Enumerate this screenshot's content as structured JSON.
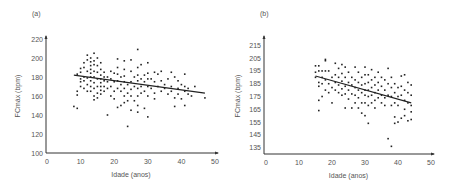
{
  "chart_data": [
    {
      "panel_label": "(a)",
      "type": "scatter",
      "xlabel": "Idade (anos)",
      "ylabel": "FCmáx (bpm)",
      "xlim": [
        0,
        50
      ],
      "ylim": [
        100,
        220
      ],
      "xticks": [
        0,
        10,
        20,
        30,
        40,
        50
      ],
      "yticks": [
        100,
        120,
        140,
        160,
        180,
        200,
        220
      ],
      "grid": false,
      "trendline": {
        "x": [
          8,
          47
        ],
        "y": [
          182,
          163
        ]
      },
      "points": [
        [
          8,
          149
        ],
        [
          9,
          147
        ],
        [
          9,
          183
        ],
        [
          9,
          161
        ],
        [
          9,
          165
        ],
        [
          10,
          189
        ],
        [
          10,
          185
        ],
        [
          10,
          175
        ],
        [
          10,
          170
        ],
        [
          10,
          178
        ],
        [
          11,
          195
        ],
        [
          11,
          190
        ],
        [
          11,
          180
        ],
        [
          11,
          176
        ],
        [
          11,
          168
        ],
        [
          12,
          203
        ],
        [
          12,
          198
        ],
        [
          12,
          186
        ],
        [
          12,
          179
        ],
        [
          12,
          172
        ],
        [
          12,
          165
        ],
        [
          13,
          200
        ],
        [
          13,
          196
        ],
        [
          13,
          192
        ],
        [
          13,
          188
        ],
        [
          13,
          184
        ],
        [
          13,
          180
        ],
        [
          13,
          176
        ],
        [
          13,
          170
        ],
        [
          13,
          165
        ],
        [
          14,
          205
        ],
        [
          14,
          197
        ],
        [
          14,
          193
        ],
        [
          14,
          186
        ],
        [
          14,
          180
        ],
        [
          14,
          174
        ],
        [
          14,
          168
        ],
        [
          14,
          160
        ],
        [
          14,
          156
        ],
        [
          15,
          200
        ],
        [
          15,
          192
        ],
        [
          15,
          185
        ],
        [
          15,
          178
        ],
        [
          15,
          170
        ],
        [
          15,
          163
        ],
        [
          15,
          158
        ],
        [
          16,
          195
        ],
        [
          16,
          188
        ],
        [
          16,
          182
        ],
        [
          16,
          178
        ],
        [
          16,
          174
        ],
        [
          16,
          170
        ],
        [
          16,
          166
        ],
        [
          16,
          162
        ],
        [
          17,
          185
        ],
        [
          17,
          180
        ],
        [
          17,
          176
        ],
        [
          17,
          170
        ],
        [
          17,
          165
        ],
        [
          18,
          140
        ],
        [
          18,
          175
        ],
        [
          18,
          180
        ],
        [
          18,
          168
        ],
        [
          19,
          186
        ],
        [
          19,
          178
        ],
        [
          19,
          170
        ],
        [
          19,
          160
        ],
        [
          20,
          184
        ],
        [
          20,
          175
        ],
        [
          20,
          165
        ],
        [
          20,
          157
        ],
        [
          21,
          199
        ],
        [
          21,
          190
        ],
        [
          21,
          183
        ],
        [
          21,
          176
        ],
        [
          21,
          168
        ],
        [
          21,
          148
        ],
        [
          22,
          180
        ],
        [
          22,
          172
        ],
        [
          22,
          165
        ],
        [
          22,
          150
        ],
        [
          23,
          197
        ],
        [
          23,
          188
        ],
        [
          23,
          181
        ],
        [
          23,
          175
        ],
        [
          23,
          168
        ],
        [
          23,
          160
        ],
        [
          23,
          153
        ],
        [
          24,
          128
        ],
        [
          24,
          172
        ],
        [
          24,
          163
        ],
        [
          24,
          155
        ],
        [
          25,
          198
        ],
        [
          25,
          186
        ],
        [
          25,
          175
        ],
        [
          25,
          167
        ],
        [
          25,
          160
        ],
        [
          25,
          145
        ],
        [
          26,
          180
        ],
        [
          26,
          170
        ],
        [
          26,
          155
        ],
        [
          27,
          209
        ],
        [
          27,
          190
        ],
        [
          27,
          182
        ],
        [
          27,
          176
        ],
        [
          27,
          168
        ],
        [
          27,
          160
        ],
        [
          27,
          150
        ],
        [
          27,
          143
        ],
        [
          28,
          193
        ],
        [
          28,
          178
        ],
        [
          28,
          170
        ],
        [
          28,
          163
        ],
        [
          29,
          182
        ],
        [
          29,
          175
        ],
        [
          29,
          147
        ],
        [
          29,
          165
        ],
        [
          30,
          195
        ],
        [
          30,
          184
        ],
        [
          30,
          178
        ],
        [
          30,
          170
        ],
        [
          30,
          160
        ],
        [
          30,
          138
        ],
        [
          31,
          178
        ],
        [
          31,
          168
        ],
        [
          32,
          185
        ],
        [
          32,
          175
        ],
        [
          32,
          163
        ],
        [
          32,
          157
        ],
        [
          33,
          183
        ],
        [
          33,
          170
        ],
        [
          34,
          186
        ],
        [
          34,
          176
        ],
        [
          34,
          165
        ],
        [
          35,
          172
        ],
        [
          35,
          168
        ],
        [
          36,
          178
        ],
        [
          36,
          162
        ],
        [
          37,
          185
        ],
        [
          37,
          170
        ],
        [
          37,
          165
        ],
        [
          38,
          180
        ],
        [
          38,
          158
        ],
        [
          38,
          149
        ],
        [
          39,
          176
        ],
        [
          39,
          168
        ],
        [
          39,
          162
        ],
        [
          40,
          172
        ],
        [
          40,
          157
        ],
        [
          41,
          183
        ],
        [
          41,
          170
        ],
        [
          41,
          165
        ],
        [
          41,
          150
        ],
        [
          42,
          168
        ],
        [
          42,
          162
        ],
        [
          43,
          160
        ],
        [
          44,
          170
        ],
        [
          47,
          158
        ]
      ]
    },
    {
      "panel_label": "(b)",
      "type": "scatter",
      "xlabel": "Idade (anos)",
      "ylabel": "FCmáx (bpm)",
      "xlim": [
        0,
        50
      ],
      "ylim": [
        130,
        220
      ],
      "xticks": [
        0,
        10,
        20,
        30,
        40,
        50
      ],
      "yticks": [
        135,
        145,
        155,
        165,
        175,
        185,
        195,
        205,
        215
      ],
      "grid": false,
      "trendline": {
        "x": [
          15,
          44
        ],
        "y": [
          191,
          170
        ]
      },
      "points": [
        [
          15,
          199
        ],
        [
          15,
          194
        ],
        [
          15,
          190
        ],
        [
          16,
          199
        ],
        [
          16,
          195
        ],
        [
          16,
          186
        ],
        [
          16,
          183
        ],
        [
          16,
          164
        ],
        [
          16,
          172
        ],
        [
          17,
          195
        ],
        [
          17,
          190
        ],
        [
          17,
          185
        ],
        [
          17,
          175
        ],
        [
          18,
          204
        ],
        [
          18,
          203
        ],
        [
          18,
          195
        ],
        [
          18,
          188
        ],
        [
          18,
          180
        ],
        [
          19,
          195
        ],
        [
          19,
          185
        ],
        [
          19,
          178
        ],
        [
          20,
          190
        ],
        [
          20,
          182
        ],
        [
          20,
          170
        ],
        [
          21,
          201
        ],
        [
          21,
          192
        ],
        [
          21,
          186
        ],
        [
          21,
          180
        ],
        [
          22,
          197
        ],
        [
          22,
          190
        ],
        [
          22,
          184
        ],
        [
          22,
          178
        ],
        [
          23,
          200
        ],
        [
          23,
          193
        ],
        [
          23,
          187
        ],
        [
          23,
          181
        ],
        [
          23,
          176
        ],
        [
          24,
          198
        ],
        [
          24,
          190
        ],
        [
          24,
          183
        ],
        [
          24,
          177
        ],
        [
          24,
          166
        ],
        [
          25,
          194
        ],
        [
          25,
          186
        ],
        [
          25,
          180
        ],
        [
          25,
          173
        ],
        [
          26,
          190
        ],
        [
          26,
          184
        ],
        [
          26,
          177
        ],
        [
          26,
          166
        ],
        [
          27,
          198
        ],
        [
          27,
          188
        ],
        [
          27,
          182
        ],
        [
          27,
          176
        ],
        [
          27,
          170
        ],
        [
          28,
          194
        ],
        [
          28,
          186
        ],
        [
          28,
          180
        ],
        [
          28,
          174
        ],
        [
          28,
          166
        ],
        [
          29,
          190
        ],
        [
          29,
          184
        ],
        [
          29,
          178
        ],
        [
          29,
          170
        ],
        [
          29,
          162
        ],
        [
          30,
          198
        ],
        [
          30,
          192
        ],
        [
          30,
          185
        ],
        [
          30,
          180
        ],
        [
          30,
          176
        ],
        [
          30,
          170
        ],
        [
          30,
          160
        ],
        [
          31,
          192
        ],
        [
          31,
          186
        ],
        [
          31,
          180
        ],
        [
          31,
          175
        ],
        [
          31,
          168
        ],
        [
          31,
          154
        ],
        [
          32,
          196
        ],
        [
          32,
          188
        ],
        [
          32,
          182
        ],
        [
          32,
          176
        ],
        [
          32,
          170
        ],
        [
          33,
          190
        ],
        [
          33,
          184
        ],
        [
          33,
          178
        ],
        [
          33,
          172
        ],
        [
          33,
          166
        ],
        [
          34,
          194
        ],
        [
          34,
          186
        ],
        [
          34,
          180
        ],
        [
          34,
          174
        ],
        [
          35,
          190
        ],
        [
          35,
          183
        ],
        [
          35,
          176
        ],
        [
          35,
          170
        ],
        [
          36,
          188
        ],
        [
          36,
          180
        ],
        [
          36,
          174
        ],
        [
          36,
          168
        ],
        [
          37,
          197
        ],
        [
          37,
          185
        ],
        [
          37,
          176
        ],
        [
          37,
          142
        ],
        [
          38,
          190
        ],
        [
          38,
          182
        ],
        [
          38,
          175
        ],
        [
          38,
          168
        ],
        [
          38,
          136
        ],
        [
          39,
          185
        ],
        [
          39,
          178
        ],
        [
          39,
          170
        ],
        [
          39,
          159
        ],
        [
          39,
          154
        ],
        [
          40,
          182
        ],
        [
          40,
          175
        ],
        [
          40,
          168
        ],
        [
          40,
          155
        ],
        [
          41,
          191
        ],
        [
          41,
          183
        ],
        [
          41,
          176
        ],
        [
          41,
          158
        ],
        [
          42,
          192
        ],
        [
          42,
          180
        ],
        [
          42,
          172
        ],
        [
          42,
          165
        ],
        [
          42,
          160
        ],
        [
          43,
          186
        ],
        [
          43,
          178
        ],
        [
          43,
          170
        ],
        [
          43,
          156
        ],
        [
          44,
          184
        ],
        [
          44,
          176
        ],
        [
          44,
          168
        ],
        [
          44,
          163
        ],
        [
          44,
          157
        ]
      ]
    }
  ]
}
